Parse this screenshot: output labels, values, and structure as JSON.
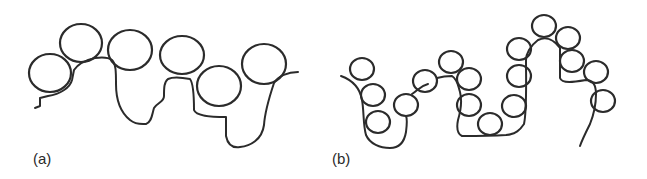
{
  "figure": {
    "panels": [
      {
        "id": "a",
        "label": "(a)",
        "description": "Polymer chain with large adsorbed beads (loops and tails)",
        "beads": [
          {
            "cx": 50,
            "cy": 73,
            "rx": 21,
            "ry": 19
          },
          {
            "cx": 81,
            "cy": 43,
            "rx": 21,
            "ry": 19
          },
          {
            "cx": 130,
            "cy": 50,
            "rx": 22,
            "ry": 20
          },
          {
            "cx": 182,
            "cy": 55,
            "rx": 22,
            "ry": 19
          },
          {
            "cx": 219,
            "cy": 86,
            "rx": 22,
            "ry": 20
          },
          {
            "cx": 264,
            "cy": 64,
            "rx": 22,
            "ry": 20
          }
        ]
      },
      {
        "id": "b",
        "label": "(b)",
        "description": "Polymer chain with many small adsorbed beads",
        "beads": [
          {
            "cx": 362,
            "cy": 69,
            "rx": 12,
            "ry": 11
          },
          {
            "cx": 373,
            "cy": 95,
            "rx": 12,
            "ry": 11
          },
          {
            "cx": 378,
            "cy": 122,
            "rx": 12,
            "ry": 11
          },
          {
            "cx": 406,
            "cy": 105,
            "rx": 12,
            "ry": 11
          },
          {
            "cx": 425,
            "cy": 81,
            "rx": 12,
            "ry": 11
          },
          {
            "cx": 451,
            "cy": 62,
            "rx": 12,
            "ry": 11
          },
          {
            "cx": 469,
            "cy": 79,
            "rx": 12,
            "ry": 11
          },
          {
            "cx": 469,
            "cy": 105,
            "rx": 12,
            "ry": 11
          },
          {
            "cx": 490,
            "cy": 124,
            "rx": 12,
            "ry": 11
          },
          {
            "cx": 514,
            "cy": 106,
            "rx": 12,
            "ry": 11
          },
          {
            "cx": 519,
            "cy": 76,
            "rx": 12,
            "ry": 11
          },
          {
            "cx": 519,
            "cy": 49,
            "rx": 12,
            "ry": 11
          },
          {
            "cx": 544,
            "cy": 26,
            "rx": 12,
            "ry": 11
          },
          {
            "cx": 568,
            "cy": 38,
            "rx": 12,
            "ry": 11
          },
          {
            "cx": 572,
            "cy": 61,
            "rx": 12,
            "ry": 11
          },
          {
            "cx": 596,
            "cy": 72,
            "rx": 12,
            "ry": 11
          },
          {
            "cx": 603,
            "cy": 101,
            "rx": 12,
            "ry": 11
          }
        ]
      }
    ]
  }
}
